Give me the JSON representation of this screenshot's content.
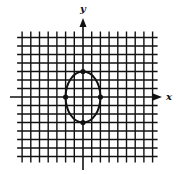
{
  "figure": {
    "type": "coordinate-grid-ellipse",
    "x_axis_label": "x",
    "y_axis_label": "y",
    "grid": {
      "origin_px": [
        83,
        97
      ],
      "spacing_x_px": 8.7,
      "spacing_y_px": 8.5,
      "x_units": [
        -7,
        8
      ],
      "y_units": [
        -7,
        7
      ]
    },
    "ellipse": {
      "center": [
        0,
        0
      ],
      "semi_axis_x": 2,
      "semi_axis_y": 3,
      "marked_points": [
        [
          0,
          3
        ],
        [
          0,
          -3
        ],
        [
          -2,
          0
        ],
        [
          2,
          0
        ]
      ]
    },
    "colors": {
      "line": "#111111",
      "background": "#ffffff"
    }
  }
}
